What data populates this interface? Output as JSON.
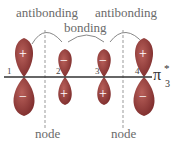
{
  "diagram": {
    "orbital_label": "π",
    "orbital_superscript": "*",
    "orbital_subscript": "3",
    "labels": {
      "antibonding_left": "antibonding",
      "antibonding_right": "antibonding",
      "bonding": "bonding",
      "node_left": "node",
      "node_right": "node"
    },
    "atoms": [
      {
        "number": "1",
        "top_sign": "+",
        "bottom_sign": "−"
      },
      {
        "number": "2",
        "top_sign": "−",
        "bottom_sign": "+"
      },
      {
        "number": "3",
        "top_sign": "−",
        "bottom_sign": "+"
      },
      {
        "number": "4",
        "top_sign": "+",
        "bottom_sign": "−"
      }
    ],
    "colors": {
      "lobe": "#8a2f2f",
      "lobe_highlight": "#b8605a",
      "axis": "#333333",
      "text": "#6a6a6a"
    }
  }
}
